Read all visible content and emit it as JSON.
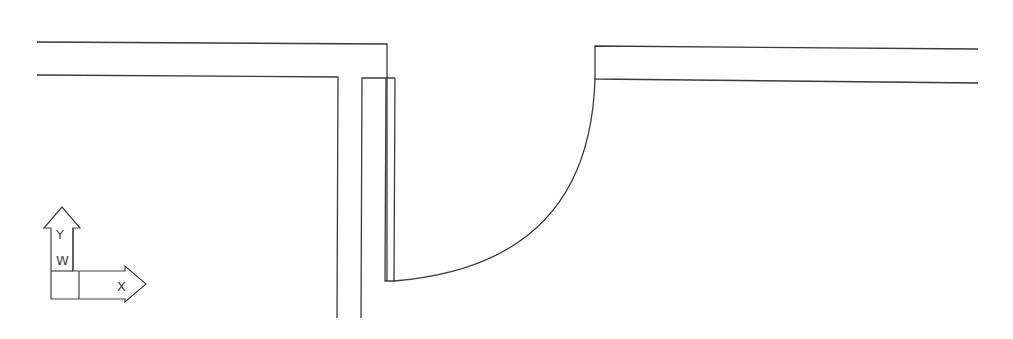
{
  "drawing": {
    "background": "#ffffff",
    "line_color": "#3a3a3a",
    "elements": [
      "left-wall",
      "partition-wall",
      "door-leaf",
      "door-swing-arc",
      "right-wall"
    ]
  },
  "ucs_icon": {
    "y_label": "Y",
    "x_label": "X",
    "w_label": "W"
  }
}
